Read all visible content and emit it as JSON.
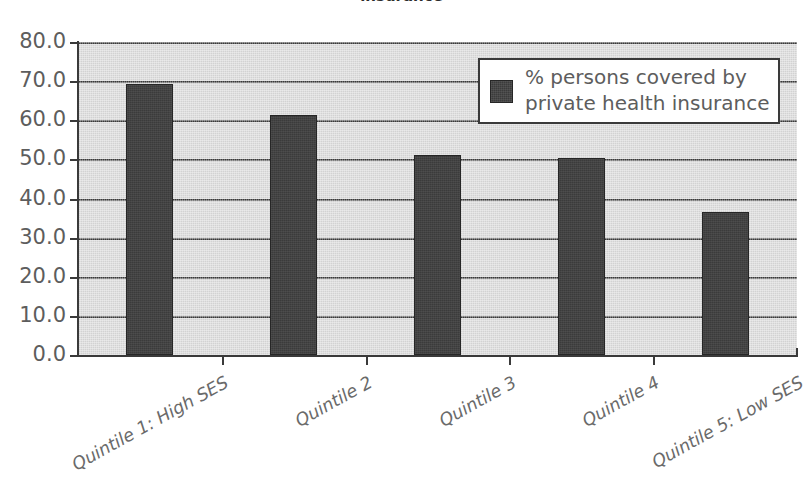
{
  "chart_data": {
    "type": "bar",
    "title": "insurance",
    "xlabel": "",
    "ylabel": "",
    "ylim": [
      0,
      80
    ],
    "yticks": [
      "0.0",
      "10.0",
      "20.0",
      "30.0",
      "40.0",
      "50.0",
      "60.0",
      "70.0",
      "80.0"
    ],
    "ytick_values": [
      0,
      10,
      20,
      30,
      40,
      50,
      60,
      70,
      80
    ],
    "grid": true,
    "grid_axis": "y",
    "legend_position": "top-right",
    "categories": [
      "Quintile 1: High SES",
      "Quintile 2",
      "Quintile 3",
      "Quintile 4",
      "Quintile 5: Low SES"
    ],
    "series": [
      {
        "name": "% persons covered by private health insurance",
        "values": [
          69.3,
          61.4,
          51.2,
          50.4,
          36.6
        ],
        "color": "#3b3b3b"
      }
    ]
  },
  "legend": {
    "entries": [
      {
        "label_line1": "% persons covered by",
        "label_line2": "private health insurance"
      }
    ]
  },
  "colors": {
    "plot_background": "#d2d2d2",
    "bar_fill": "#3b3b3b",
    "axis": "#3a3a3a",
    "tick_label": "#5d5d5d",
    "category_label": "#6a6a6a",
    "legend_background": "#ffffff",
    "page_background": "#ffffff"
  }
}
